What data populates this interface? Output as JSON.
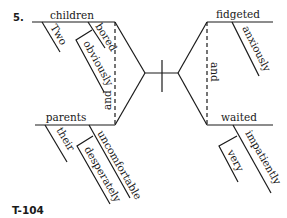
{
  "exercise_number": "5.",
  "page_label": "T-104",
  "diagram": {
    "type": "sentence-diagram",
    "compound_subject": {
      "conjunction": "and",
      "subjects": [
        {
          "word": "children",
          "modifiers": [
            {
              "word": "Two"
            },
            {
              "word": "bored",
              "modifiers": [
                {
                  "word": "obviously"
                }
              ]
            }
          ]
        },
        {
          "word": "parents",
          "modifiers": [
            {
              "word": "their"
            },
            {
              "word": "uncomfortable",
              "modifiers": [
                {
                  "word": "desperately"
                }
              ]
            }
          ]
        }
      ]
    },
    "compound_predicate": {
      "conjunction": "and",
      "verbs": [
        {
          "word": "fidgeted",
          "modifiers": [
            {
              "word": "anxiously"
            }
          ]
        },
        {
          "word": "waited",
          "modifiers": [
            {
              "word": "impatiently",
              "modifiers": [
                {
                  "word": "very"
                }
              ]
            }
          ]
        }
      ]
    }
  },
  "words": {
    "children": "children",
    "two": "Two",
    "bored": "bored",
    "obviously": "obviously",
    "and_left": "and",
    "parents": "parents",
    "their": "their",
    "uncomfortable": "uncomfortable",
    "desperately": "desperately",
    "fidgeted": "fidgeted",
    "anxiously": "anxiously",
    "and_right": "and",
    "waited": "waited",
    "impatiently": "impatiently",
    "very": "very"
  }
}
